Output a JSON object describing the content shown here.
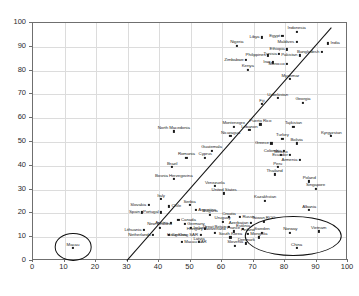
{
  "chart_data": {
    "type": "scatter",
    "title": "",
    "xlabel": "",
    "ylabel": "",
    "xlim": [
      0,
      100
    ],
    "ylim": [
      0,
      100
    ],
    "grid": true,
    "legend": "none",
    "xticks": [
      0,
      10,
      20,
      30,
      40,
      50,
      60,
      70,
      80,
      90,
      100
    ],
    "yticks": [
      0,
      10,
      20,
      30,
      40,
      50,
      60,
      70,
      80,
      90,
      100
    ],
    "point_color": "#1a1a1a",
    "trend_line": {
      "x0": 30.0,
      "y0": 0.0,
      "x1": 95.0,
      "y1": 98.0,
      "color": "#111111"
    },
    "annotations": [
      {
        "name": "macau-outlier-circle",
        "shape": "ellipse",
        "cx": 13.0,
        "cy": 5.5,
        "rx": 5.5,
        "ry": 5.5
      },
      {
        "name": "low-right-cluster-ellipse",
        "shape": "ellipse",
        "cx": 83.0,
        "cy": 10.0,
        "rx": 15.0,
        "ry": 8.0
      }
    ],
    "points": [
      {
        "label": "Indonesia",
        "x": 84.0,
        "y": 96.0,
        "pos": "c"
      },
      {
        "label": "Egypt",
        "x": 79.5,
        "y": 94.0,
        "pos": "l"
      },
      {
        "label": "Libya",
        "x": 73.0,
        "y": 93.5,
        "pos": "l"
      },
      {
        "label": "Maldives",
        "x": 84.0,
        "y": 91.5,
        "pos": "l"
      },
      {
        "label": "India",
        "x": 94.0,
        "y": 91.0,
        "pos": "r"
      },
      {
        "label": "Ethiopia",
        "x": 81.0,
        "y": 88.5,
        "pos": "l"
      },
      {
        "label": "Bangladesh",
        "x": 92.0,
        "y": 87.5,
        "pos": "l"
      },
      {
        "label": "Nigeria",
        "x": 65.0,
        "y": 90.0,
        "pos": "c"
      },
      {
        "label": "Philippines",
        "x": 75.0,
        "y": 86.0,
        "pos": "l"
      },
      {
        "label": "Tunisia",
        "x": 78.5,
        "y": 86.5,
        "pos": "l"
      },
      {
        "label": "Pakistan",
        "x": 85.0,
        "y": 86.0,
        "pos": "l"
      },
      {
        "label": "Zimbabwe",
        "x": 68.0,
        "y": 84.0,
        "pos": "l"
      },
      {
        "label": "Iraq",
        "x": 76.5,
        "y": 83.0,
        "pos": "l"
      },
      {
        "label": "Morocco",
        "x": 81.0,
        "y": 82.5,
        "pos": "l"
      },
      {
        "label": "Kenya",
        "x": 68.5,
        "y": 80.0,
        "pos": "c"
      },
      {
        "label": "Myanmar",
        "x": 82.0,
        "y": 76.0,
        "pos": "c"
      },
      {
        "label": "Uzbekistan",
        "x": 78.0,
        "y": 68.0,
        "pos": "c"
      },
      {
        "label": "Georgia",
        "x": 86.0,
        "y": 66.0,
        "pos": "c"
      },
      {
        "label": "Fiji",
        "x": 73.0,
        "y": 65.5,
        "pos": "c"
      },
      {
        "label": "Puerto Rico",
        "x": 72.5,
        "y": 57.0,
        "pos": "c"
      },
      {
        "label": "Montenegro",
        "x": 64.0,
        "y": 56.0,
        "pos": "c"
      },
      {
        "label": "Lebanon",
        "x": 69.0,
        "y": 54.5,
        "pos": "c"
      },
      {
        "label": "Nicaragua",
        "x": 63.0,
        "y": 52.0,
        "pos": "c"
      },
      {
        "label": "Tajikistan",
        "x": 83.0,
        "y": 56.0,
        "pos": "c"
      },
      {
        "label": "North Macedonia",
        "x": 45.0,
        "y": 54.0,
        "pos": "c"
      },
      {
        "label": "Kyrgyzstan",
        "x": 95.0,
        "y": 52.0,
        "pos": "c"
      },
      {
        "label": "Turkey",
        "x": 79.5,
        "y": 51.0,
        "pos": "c"
      },
      {
        "label": "Bolivia",
        "x": 84.0,
        "y": 49.0,
        "pos": "c"
      },
      {
        "label": "Greece",
        "x": 76.0,
        "y": 49.0,
        "pos": "l"
      },
      {
        "label": "Colombia",
        "x": 80.0,
        "y": 46.0,
        "pos": "l"
      },
      {
        "label": "Ecuador",
        "x": 82.0,
        "y": 44.0,
        "pos": "l"
      },
      {
        "label": "Mexico",
        "x": 79.0,
        "y": 44.0,
        "pos": "c"
      },
      {
        "label": "Armenia",
        "x": 85.0,
        "y": 42.0,
        "pos": "l"
      },
      {
        "label": "Guatemala",
        "x": 57.0,
        "y": 46.0,
        "pos": "c"
      },
      {
        "label": "Cyprus",
        "x": 55.0,
        "y": 43.0,
        "pos": "c"
      },
      {
        "label": "Romania",
        "x": 49.0,
        "y": 43.0,
        "pos": "c"
      },
      {
        "label": "Brazil",
        "x": 44.5,
        "y": 39.0,
        "pos": "c"
      },
      {
        "label": "Bosnia Herzegovina",
        "x": 45.0,
        "y": 34.0,
        "pos": "c"
      },
      {
        "label": "Peru",
        "x": 78.0,
        "y": 39.0,
        "pos": "c"
      },
      {
        "label": "Thailand",
        "x": 77.0,
        "y": 36.0,
        "pos": "c"
      },
      {
        "label": "Venezuela",
        "x": 58.0,
        "y": 31.0,
        "pos": "c"
      },
      {
        "label": "Poland",
        "x": 88.0,
        "y": 33.0,
        "pos": "c"
      },
      {
        "label": "Singapore",
        "x": 90.0,
        "y": 30.0,
        "pos": "c"
      },
      {
        "label": "United States",
        "x": 61.0,
        "y": 28.0,
        "pos": "c"
      },
      {
        "label": "Kazakhstan",
        "x": 74.0,
        "y": 25.0,
        "pos": "c"
      },
      {
        "label": "Albania",
        "x": 88.0,
        "y": 21.0,
        "pos": "c"
      },
      {
        "label": "Italy",
        "x": 41.0,
        "y": 25.5,
        "pos": "c"
      },
      {
        "label": "Slovakia",
        "x": 37.0,
        "y": 23.0,
        "pos": "l"
      },
      {
        "label": "Chile",
        "x": 43.5,
        "y": 22.5,
        "pos": "r"
      },
      {
        "label": "Serbia",
        "x": 50.0,
        "y": 23.0,
        "pos": "c"
      },
      {
        "label": "Argentina",
        "x": 52.0,
        "y": 21.0,
        "pos": "r"
      },
      {
        "label": "Spain",
        "x": 35.0,
        "y": 20.0,
        "pos": "l"
      },
      {
        "label": "Portugal",
        "x": 41.0,
        "y": 20.0,
        "pos": "l"
      },
      {
        "label": "Bulgaria",
        "x": 56.5,
        "y": 19.0,
        "pos": "c"
      },
      {
        "label": "Croatia",
        "x": 62.5,
        "y": 18.0,
        "pos": "c"
      },
      {
        "label": "Uruguay",
        "x": 60.5,
        "y": 16.0,
        "pos": "c"
      },
      {
        "label": "Russia",
        "x": 66.0,
        "y": 18.0,
        "pos": "r"
      },
      {
        "label": "Canada",
        "x": 46.5,
        "y": 17.0,
        "pos": "r"
      },
      {
        "label": "Germany",
        "x": 48.5,
        "y": 15.0,
        "pos": "r"
      },
      {
        "label": "Austria",
        "x": 44.0,
        "y": 15.5,
        "pos": "l"
      },
      {
        "label": "New Zealand",
        "x": 40.5,
        "y": 13.5,
        "pos": "c"
      },
      {
        "label": "Lithuania",
        "x": 35.5,
        "y": 12.5,
        "pos": "l"
      },
      {
        "label": "Ireland",
        "x": 50.5,
        "y": 13.5,
        "pos": "r"
      },
      {
        "label": "Finland",
        "x": 68.5,
        "y": 11.0,
        "pos": "c"
      },
      {
        "label": "Sweden",
        "x": 73.0,
        "y": 11.5,
        "pos": "c"
      },
      {
        "label": "Estonia",
        "x": 67.0,
        "y": 13.0,
        "pos": "c"
      },
      {
        "label": "Mongolia",
        "x": 72.0,
        "y": 9.5,
        "pos": "c"
      },
      {
        "label": "Norway",
        "x": 82.0,
        "y": 11.5,
        "pos": "c"
      },
      {
        "label": "Vietnam",
        "x": 91.0,
        "y": 12.0,
        "pos": "c"
      },
      {
        "label": "Taiwan ROC",
        "x": 73.5,
        "y": 16.0,
        "pos": "c"
      },
      {
        "label": "Azerbaijan",
        "x": 69.5,
        "y": 15.5,
        "pos": "l"
      },
      {
        "label": "Great Britain",
        "x": 62.5,
        "y": 14.0,
        "pos": "l"
      },
      {
        "label": "France",
        "x": 64.0,
        "y": 12.0,
        "pos": "c"
      },
      {
        "label": "Switzerland",
        "x": 58.0,
        "y": 11.5,
        "pos": "c"
      },
      {
        "label": "South Korea",
        "x": 63.0,
        "y": 9.5,
        "pos": "c"
      },
      {
        "label": "Hong Kong SAR",
        "x": 53.5,
        "y": 10.5,
        "pos": "l"
      },
      {
        "label": "Denmark",
        "x": 68.0,
        "y": 7.0,
        "pos": "c"
      },
      {
        "label": "Slovenia",
        "x": 64.5,
        "y": 6.0,
        "pos": "c"
      },
      {
        "label": "Hungary",
        "x": 55.0,
        "y": 13.0,
        "pos": "l"
      },
      {
        "label": "Netherlands",
        "x": 38.5,
        "y": 10.5,
        "pos": "l"
      },
      {
        "label": "Czechia",
        "x": 43.5,
        "y": 10.5,
        "pos": "r"
      },
      {
        "label": "Latvia",
        "x": 53.0,
        "y": 7.5,
        "pos": "c"
      },
      {
        "label": "Macau SAR",
        "x": 47.5,
        "y": 7.5,
        "pos": "r"
      },
      {
        "label": "China",
        "x": 84.0,
        "y": 5.0,
        "pos": "c"
      },
      {
        "label": "Macau",
        "x": 13.0,
        "y": 5.0,
        "pos": "c"
      }
    ]
  }
}
